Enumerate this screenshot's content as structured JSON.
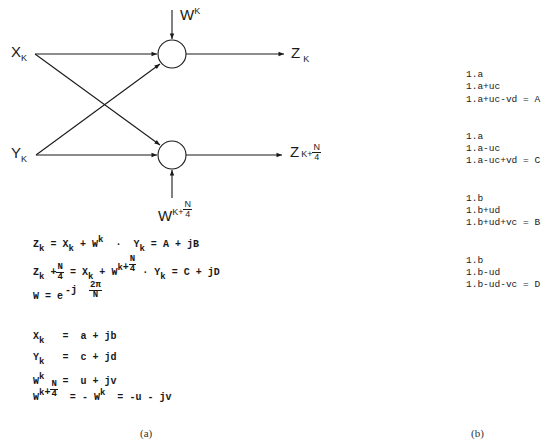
{
  "diagram": {
    "inputs": [
      {
        "base": "X",
        "sub": "K"
      },
      {
        "base": "Y",
        "sub": "K"
      }
    ],
    "twiddles": [
      {
        "base": "W",
        "sup": "K"
      },
      {
        "base": "W",
        "sup_prefix": "K+",
        "sup_frac_num": "N",
        "sup_frac_den": "4"
      }
    ],
    "outputs": [
      {
        "base": "Z",
        "sub": "K"
      },
      {
        "base": "Z",
        "sub_prefix": "K+",
        "sub_frac_num": "N",
        "sub_frac_den": "4"
      }
    ],
    "line_color": "#1a1a1a"
  },
  "equations": {
    "eq1": {
      "lhs": "Z",
      "lhs_sub": "k",
      "eq": "=",
      "x": "X",
      "x_sub": "k",
      "plus": "+",
      "w": "W",
      "w_sup": "k",
      "dot": "·",
      "y": "Y",
      "y_sub": "k",
      "eq2": "=",
      "rhs": "A + jB"
    },
    "eq2": {
      "lhs": "Z",
      "lhs_sub": "k",
      "plus_n": "+",
      "n": "N",
      "four": "4",
      "eq": "=",
      "x": "X",
      "x_sub": "k",
      "plus": "+",
      "w": "W",
      "w_sup": "k",
      "w_plus": "+",
      "dot": "·",
      "y": "Y",
      "y_sub": "k",
      "eq2": "=",
      "rhs": "C + jD"
    },
    "eq3": {
      "lhs": "W",
      "eq": "=",
      "base": "e",
      "exp_prefix": "-j",
      "exp_num": "2π",
      "exp_den": "N"
    },
    "defs": [
      {
        "lhs": "X",
        "sub": "k",
        "eq": "=",
        "rhs": "a + jb"
      },
      {
        "lhs": "Y",
        "sub": "k",
        "eq": "=",
        "rhs": "c + jd"
      },
      {
        "lhs": "W",
        "sup": "k",
        "eq": "=",
        "rhs": "u + jv"
      }
    ],
    "eq_last": {
      "lhs": "W",
      "sup": "k",
      "plus": "+",
      "n": "N",
      "four": "4",
      "eq": "=",
      "neg": "-",
      "w": "W",
      "w_sup": "k",
      "eq2": "=",
      "rhs": "-u - jv"
    }
  },
  "steps": [
    {
      "lines": [
        "1.a",
        "1.a+uc",
        "1.a+uc-vd = A"
      ]
    },
    {
      "lines": [
        "1.a",
        "1.a-uc",
        "1.a-uc+vd = C"
      ]
    },
    {
      "lines": [
        "1.b",
        "1.b+ud",
        "1.b+ud+vc = B"
      ]
    },
    {
      "lines": [
        "1.b",
        "1.b-ud",
        "1.b-ud-vc = D"
      ]
    }
  ],
  "captions": {
    "left": "(a)",
    "right": "(b)"
  }
}
